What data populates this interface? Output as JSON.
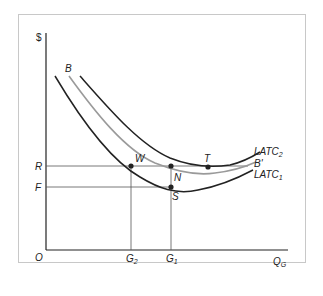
{
  "figure": {
    "y_axis_label": "$",
    "x_axis_label": "Q",
    "x_axis_label_sub": "G",
    "origin_label": "O",
    "y_ticks": [
      {
        "label": "R"
      },
      {
        "label": "F"
      }
    ],
    "x_ticks": [
      {
        "label": "G",
        "sub": "2"
      },
      {
        "label": "G",
        "sub": "1"
      }
    ],
    "curves": [
      {
        "label": "LATC",
        "sub": "2",
        "color": "#222222"
      },
      {
        "label": "B'",
        "start_label": "B",
        "color": "#9a9a9a"
      },
      {
        "label": "LATC",
        "sub": "1",
        "color": "#222222"
      }
    ],
    "points": [
      {
        "label": "W"
      },
      {
        "label": "N"
      },
      {
        "label": "S"
      },
      {
        "label": "T"
      }
    ],
    "colors": {
      "frame": "#c8c8c8",
      "axis": "#222222",
      "guide": "#555555",
      "gray_curve": "#9a9a9a"
    }
  }
}
